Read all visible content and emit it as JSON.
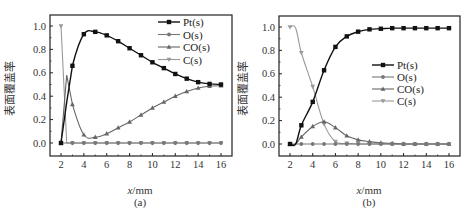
{
  "chart_data": [
    {
      "type": "line",
      "panel_label": "(a)",
      "title": "",
      "xlabel_italic": "x",
      "xlabel_rest": "/mm",
      "ylabel": "表面覆盖率",
      "xlim": [
        1,
        17
      ],
      "ylim": [
        -0.05,
        1.1
      ],
      "x_ticks": [
        2,
        4,
        6,
        8,
        10,
        12,
        14,
        16
      ],
      "y_ticks": [
        "0.0",
        "0.2",
        "0.4",
        "0.6",
        "0.8",
        "1.0"
      ],
      "grid": false,
      "legend_position": "upper right",
      "x": [
        2,
        2.5,
        3,
        4,
        5,
        6,
        7,
        8,
        9,
        10,
        11,
        12,
        13,
        14,
        15,
        16
      ],
      "series": [
        {
          "name": "Pt(s)",
          "color": "#111111",
          "marker": "square",
          "values": [
            0.0,
            0.35,
            0.66,
            0.93,
            0.95,
            0.92,
            0.87,
            0.81,
            0.75,
            0.69,
            0.64,
            0.59,
            0.55,
            0.52,
            0.505,
            0.5
          ]
        },
        {
          "name": "O(s)",
          "color": "#777777",
          "marker": "circle",
          "values": [
            0.0,
            0.0,
            0.0,
            0.0,
            0.0,
            0.0,
            0.0,
            0.0,
            0.0,
            0.0,
            0.0,
            0.0,
            0.0,
            0.0,
            0.0,
            0.0
          ]
        },
        {
          "name": "CO(s)",
          "color": "#666666",
          "marker": "triangle",
          "values": [
            0.0,
            0.58,
            0.33,
            0.07,
            0.05,
            0.08,
            0.13,
            0.18,
            0.24,
            0.3,
            0.35,
            0.4,
            0.44,
            0.47,
            0.485,
            0.49
          ]
        },
        {
          "name": "C(s)",
          "color": "#999999",
          "marker": "triangle-down",
          "values": [
            1.0,
            0.0,
            0.0,
            0.0,
            0.0,
            0.0,
            0.0,
            0.0,
            0.0,
            0.0,
            0.0,
            0.0,
            0.0,
            0.0,
            0.0,
            0.0
          ]
        }
      ]
    },
    {
      "type": "line",
      "panel_label": "(b)",
      "title": "",
      "xlabel_italic": "x",
      "xlabel_rest": "/mm",
      "ylabel": "表面覆盖率",
      "xlim": [
        1,
        17
      ],
      "ylim": [
        -0.05,
        1.1
      ],
      "x_ticks": [
        2,
        4,
        6,
        8,
        10,
        12,
        14,
        16
      ],
      "y_ticks": [
        "0.0",
        "0.2",
        "0.4",
        "0.6",
        "0.8",
        "1.0"
      ],
      "grid": false,
      "legend_position": "center right",
      "x": [
        2,
        2.5,
        3,
        4,
        5,
        6,
        7,
        8,
        9,
        10,
        11,
        12,
        13,
        14,
        15,
        16
      ],
      "series": [
        {
          "name": "Pt(s)",
          "color": "#111111",
          "marker": "square",
          "values": [
            0.0,
            0.0,
            0.16,
            0.36,
            0.63,
            0.83,
            0.92,
            0.96,
            0.98,
            0.985,
            0.99,
            0.99,
            0.99,
            0.99,
            0.99,
            0.99
          ]
        },
        {
          "name": "O(s)",
          "color": "#777777",
          "marker": "circle",
          "values": [
            0.0,
            0.0,
            0.0,
            0.0,
            0.0,
            0.0,
            0.0,
            0.0,
            0.0,
            0.0,
            0.0,
            0.0,
            0.0,
            0.0,
            0.0,
            0.0
          ]
        },
        {
          "name": "CO(s)",
          "color": "#666666",
          "marker": "triangle",
          "values": [
            0.0,
            0.0,
            0.06,
            0.15,
            0.19,
            0.14,
            0.07,
            0.035,
            0.02,
            0.01,
            0.005,
            0.0,
            0.0,
            0.0,
            0.0,
            0.0
          ]
        },
        {
          "name": "C(s)",
          "color": "#999999",
          "marker": "triangle-down",
          "values": [
            1.0,
            0.99,
            0.78,
            0.49,
            0.17,
            0.02,
            0.005,
            0.0,
            0.0,
            0.0,
            0.0,
            0.0,
            0.0,
            0.0,
            0.0,
            0.0
          ]
        }
      ]
    }
  ]
}
